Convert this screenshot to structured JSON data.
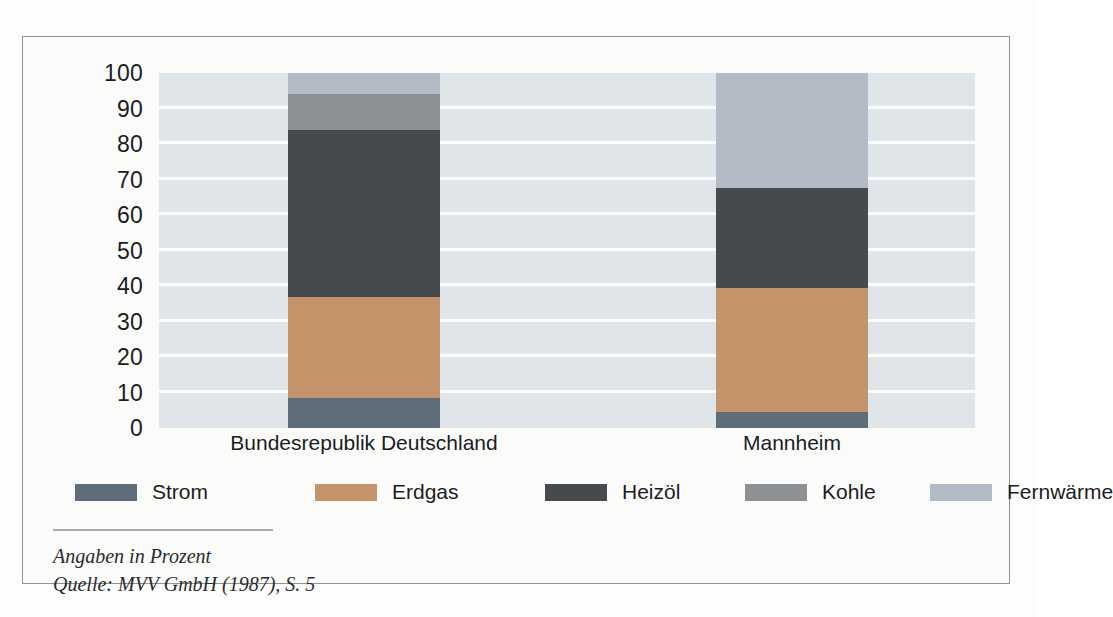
{
  "chart_data": {
    "type": "bar",
    "subtype": "stacked-bar-100",
    "title": "",
    "xlabel": "",
    "ylabel": "",
    "ylim": [
      0,
      100
    ],
    "yticks": [
      0,
      10,
      20,
      30,
      40,
      50,
      60,
      70,
      80,
      90,
      100
    ],
    "ytick_labels": [
      "0",
      "10",
      "20",
      "30",
      "40",
      "50",
      "60",
      "70",
      "80",
      "90",
      "100"
    ],
    "grid": true,
    "grid_axis": "y",
    "legend_position": "bottom",
    "categories": [
      "Bundesrepublik Deutschland",
      "Mannheim"
    ],
    "series": [
      {
        "name": "Strom",
        "color": "#5f6c7a",
        "values": [
          8.5,
          4.5
        ]
      },
      {
        "name": "Erdgas",
        "color": "#c4936a",
        "values": [
          28.5,
          35.0
        ]
      },
      {
        "name": "Heizöl",
        "color": "#474a4d",
        "values": [
          47.0,
          28.0
        ]
      },
      {
        "name": "Kohle",
        "color": "#8e9194",
        "values": [
          10.0,
          0.0
        ]
      },
      {
        "name": "Fernwärme",
        "color": "#b3bcc6",
        "values": [
          6.0,
          32.5
        ]
      }
    ],
    "annotations": [
      "Angaben in Prozent",
      "Quelle: MVV GmbH (1987), S. 5"
    ],
    "units": "Prozent"
  },
  "axis": {
    "y_tick_labels": [
      "100",
      "90",
      "80",
      "70",
      "60",
      "50",
      "40",
      "30",
      "20",
      "10",
      "0"
    ]
  },
  "categories": [
    {
      "label": "Bundesrepublik Deutschland"
    },
    {
      "label": "Mannheim"
    }
  ],
  "legend": {
    "items": [
      {
        "label": "Strom",
        "color": "#5f6c7a"
      },
      {
        "label": "Erdgas",
        "color": "#c4936a"
      },
      {
        "label": "Heizöl",
        "color": "#474a4d"
      },
      {
        "label": "Kohle",
        "color": "#8e9194"
      },
      {
        "label": "Fernwärme",
        "color": "#b3bcc6"
      }
    ]
  },
  "caption": {
    "line1": "Angaben in Prozent",
    "line2": "Quelle: MVV GmbH (1987), S. 5"
  },
  "colors": {
    "plot_background": "#dfe5e8",
    "gridline": "#fbfcfc",
    "frame_border": "#8f9194",
    "page_background": "#fdfdfd",
    "text": "#1b1c1e"
  }
}
